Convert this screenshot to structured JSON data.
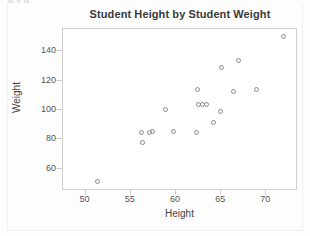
{
  "figure": {
    "clipped_header_text": "g            y  g",
    "background_color": "#fdfdfd",
    "frame_color": "#cfcfcf",
    "marker_color": "#8a8a95"
  },
  "chart_data": {
    "type": "scatter",
    "title": "Student Height by Student Weight",
    "xlabel": "Height",
    "ylabel": "Weight",
    "xlim": [
      47.5,
      73.5
    ],
    "ylim": [
      45,
      155
    ],
    "xticks": [
      50,
      55,
      60,
      65,
      70
    ],
    "yticks": [
      60,
      80,
      100,
      120,
      140
    ],
    "grid": false,
    "legend": null,
    "marker": "open-circle",
    "series": [
      {
        "name": "students",
        "x": [
          51.4,
          56.3,
          56.4,
          57.2,
          57.5,
          59.0,
          59.8,
          62.4,
          62.5,
          62.6,
          63.0,
          63.5,
          64.3,
          65.0,
          65.1,
          66.5,
          67.0,
          69.0,
          72.0
        ],
        "y": [
          51,
          84,
          77,
          84,
          85,
          100,
          85,
          84,
          113,
          103,
          103,
          103,
          91,
          98,
          128,
          112,
          133,
          113,
          149
        ]
      }
    ],
    "points": [
      {
        "height": 51.4,
        "weight": 51
      },
      {
        "height": 56.3,
        "weight": 84
      },
      {
        "height": 56.4,
        "weight": 77
      },
      {
        "height": 57.2,
        "weight": 84
      },
      {
        "height": 57.5,
        "weight": 85
      },
      {
        "height": 59.0,
        "weight": 100
      },
      {
        "height": 59.8,
        "weight": 85
      },
      {
        "height": 62.4,
        "weight": 84
      },
      {
        "height": 62.5,
        "weight": 113
      },
      {
        "height": 62.6,
        "weight": 103
      },
      {
        "height": 63.5,
        "weight": 103
      },
      {
        "height": 64.3,
        "weight": 91
      },
      {
        "height": 65.0,
        "weight": 98
      },
      {
        "height": 65.1,
        "weight": 128
      },
      {
        "height": 66.5,
        "weight": 112
      },
      {
        "height": 67.0,
        "weight": 133
      },
      {
        "height": 69.0,
        "weight": 113
      },
      {
        "height": 72.0,
        "weight": 149
      }
    ]
  }
}
